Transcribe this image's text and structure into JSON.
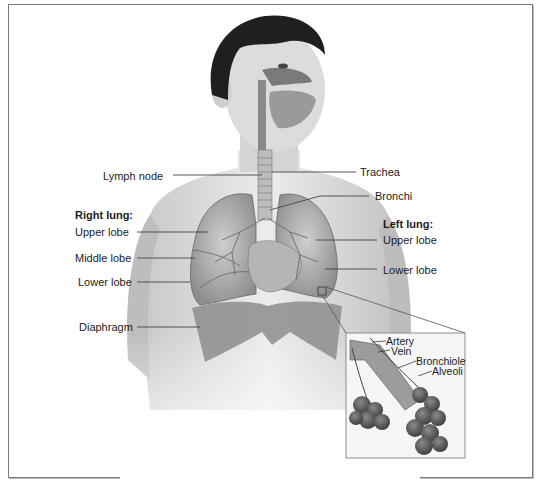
{
  "figure": {
    "caption": "Figure 1.1 The respiratory system"
  },
  "labels": {
    "lymph_node": "Lymph node",
    "trachea": "Trachea",
    "bronchi": "Bronchi",
    "right_lung_heading": "Right lung:",
    "right_upper_lobe": "Upper lobe",
    "right_middle_lobe": "Middle lobe",
    "right_lower_lobe": "Lower lobe",
    "diaphragm": "Diaphragm",
    "left_lung_heading": "Left lung:",
    "left_upper_lobe": "Upper lobe",
    "left_lower_lobe": "Lower lobe"
  },
  "inset": {
    "artery": "Artery",
    "vein": "Vein",
    "bronchiole": "Bronchiole",
    "alveoli": "Alveoli"
  },
  "colors": {
    "frame_border": "#7a7a7a",
    "leader_line": "#444444",
    "hair": "#1e1e1e",
    "skin": "#d9d9d9",
    "lung": "#a8a8a8",
    "diaphragm": "#8a8a8a"
  }
}
